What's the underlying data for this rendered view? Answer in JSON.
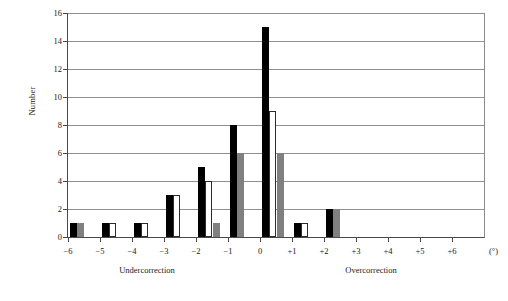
{
  "chart_data": {
    "type": "bar",
    "title": "",
    "xlabel": "(°)",
    "ylabel": "Number",
    "categories": [
      "−6",
      "−5",
      "−4",
      "−3",
      "−2",
      "−1",
      "0",
      "+1",
      "+2",
      "+3",
      "+4",
      "+5",
      "+6"
    ],
    "series": [
      {
        "name": "black",
        "color": "#000000",
        "values": [
          1,
          1,
          1,
          3,
          5,
          8,
          15,
          1,
          2,
          0,
          0,
          0,
          0
        ]
      },
      {
        "name": "white",
        "color": "#ffffff",
        "values": [
          0,
          1,
          1,
          3,
          4,
          0,
          9,
          1,
          0,
          0,
          0,
          0,
          0
        ]
      },
      {
        "name": "gray",
        "color": "#808080",
        "values": [
          1,
          0,
          0,
          0,
          1,
          6,
          6,
          0,
          2,
          0,
          0,
          0,
          0
        ]
      }
    ],
    "ylim": [
      0,
      16
    ],
    "yticks": [
      0,
      2,
      4,
      6,
      8,
      10,
      12,
      14,
      16
    ],
    "ytick_labels": [
      "0",
      "2",
      "4",
      "6",
      "8",
      "10",
      "12",
      "14",
      "16"
    ],
    "grid": "horizontal",
    "legend": "none",
    "annotations": {
      "left_region": "Undercorrection",
      "right_region": "Overcorrection",
      "unit": "(°)"
    }
  }
}
